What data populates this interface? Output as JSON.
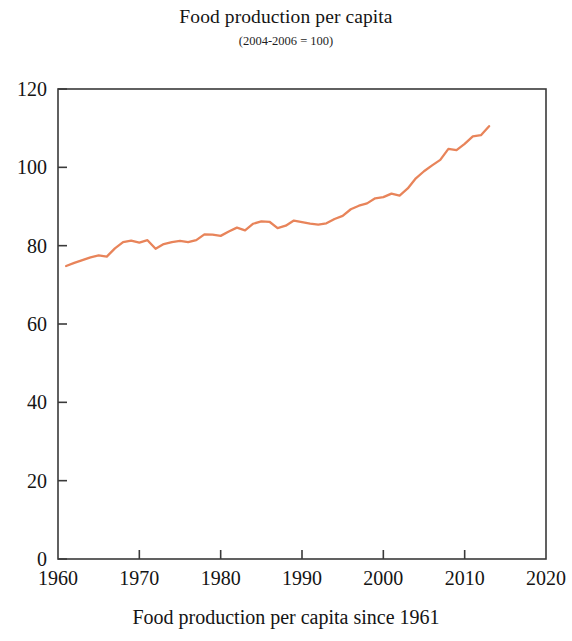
{
  "chart_data": {
    "type": "line",
    "title": "Food production per capita",
    "subtitle": "(2004-2006 = 100)",
    "caption": "Food production per capita since 1961",
    "xlabel": "",
    "ylabel": "",
    "xlim": [
      1960,
      2020
    ],
    "ylim": [
      0,
      120
    ],
    "xticks": [
      1960,
      1970,
      1980,
      1990,
      2000,
      2010,
      2020
    ],
    "yticks": [
      0,
      20,
      40,
      60,
      80,
      100,
      120
    ],
    "grid": false,
    "legend": null,
    "line_color": "#e8845a",
    "series": [
      {
        "name": "Food production per capita index",
        "x": [
          1961,
          1962,
          1963,
          1964,
          1965,
          1966,
          1967,
          1968,
          1969,
          1970,
          1971,
          1972,
          1973,
          1974,
          1975,
          1976,
          1977,
          1978,
          1979,
          1980,
          1981,
          1982,
          1983,
          1984,
          1985,
          1986,
          1987,
          1988,
          1989,
          1990,
          1991,
          1992,
          1993,
          1994,
          1995,
          1996,
          1997,
          1998,
          1999,
          2000,
          2001,
          2002,
          2003,
          2004,
          2005,
          2006,
          2007,
          2008,
          2009,
          2010,
          2011,
          2012,
          2013
        ],
        "values": [
          74.8,
          75.6,
          76.3,
          77.0,
          77.5,
          77.2,
          79.3,
          80.9,
          81.3,
          80.8,
          81.4,
          79.2,
          80.4,
          80.9,
          81.2,
          80.9,
          81.4,
          82.9,
          82.8,
          82.5,
          83.6,
          84.6,
          83.9,
          85.6,
          86.2,
          86.1,
          84.5,
          85.1,
          86.4,
          86.0,
          85.6,
          85.4,
          85.7,
          86.8,
          87.6,
          89.3,
          90.2,
          90.8,
          92.1,
          92.4,
          93.3,
          92.8,
          94.6,
          97.2,
          99.0,
          100.5,
          101.9,
          104.7,
          104.4,
          106.0,
          107.9,
          108.2,
          110.5
        ]
      }
    ]
  },
  "axis": {
    "y_tick_labels": [
      "120",
      "100",
      "80",
      "60",
      "40",
      "20",
      "0"
    ],
    "x_tick_labels": [
      "1960",
      "1970",
      "1980",
      "1990",
      "2000",
      "2010",
      "2020"
    ]
  }
}
